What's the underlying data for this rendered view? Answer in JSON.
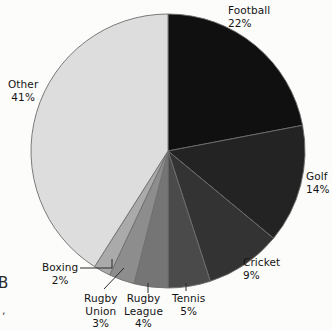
{
  "chart_data": {
    "type": "pie",
    "title": "",
    "subtitle": "",
    "xlabel": "",
    "ylabel": "",
    "legend_position": "none",
    "labels_position": "outside",
    "grid": false,
    "units": "percent",
    "total": 100,
    "start_angle_deg": 0,
    "direction": "clockwise",
    "categories": [
      "Football",
      "Golf",
      "Cricket",
      "Tennis",
      "Rugby League",
      "Rugby Union",
      "Boxing",
      "Other"
    ],
    "values": [
      22,
      14,
      9,
      5,
      4,
      3,
      2,
      41
    ],
    "slices": [
      {
        "name": "Football",
        "label": "Football",
        "pct_text": "22%",
        "value": 22,
        "color": "#101010",
        "label_align": "left",
        "leader": "none"
      },
      {
        "name": "Golf",
        "label": "Golf",
        "pct_text": "14%",
        "value": 14,
        "color": "#232323",
        "label_align": "left",
        "leader": "none"
      },
      {
        "name": "Cricket",
        "label": "Cricket",
        "pct_text": "9%",
        "value": 9,
        "color": "#333333",
        "label_align": "left",
        "leader": "none"
      },
      {
        "name": "Tennis",
        "label": "Tennis",
        "pct_text": "5%",
        "value": 5,
        "color": "#4a4a4a",
        "label_align": "center",
        "leader": "tick"
      },
      {
        "name": "Rugby League",
        "label": "Rugby\nLeague",
        "pct_text": "4%",
        "value": 4,
        "color": "#757575",
        "label_align": "center",
        "leader": "tick"
      },
      {
        "name": "Rugby Union",
        "label": "Rugby\nUnion",
        "pct_text": "3%",
        "value": 3,
        "color": "#8d8d8d",
        "label_align": "center",
        "leader": "diagonal"
      },
      {
        "name": "Boxing",
        "label": "Boxing",
        "pct_text": "2%",
        "value": 2,
        "color": "#aaaaaa",
        "label_align": "center",
        "leader": "elbow"
      },
      {
        "name": "Other",
        "label": "Other",
        "pct_text": "41%",
        "value": 41,
        "color": "#dddddd",
        "label_align": "center",
        "leader": "none"
      }
    ],
    "geometry": {
      "cx": 168,
      "cy": 151,
      "r": 137
    },
    "style": {
      "background": "#fcfcfa",
      "outline": "#6d6d6d",
      "text": "#141414"
    }
  },
  "labels": {
    "football": {
      "name": "Football",
      "pct": "22%"
    },
    "golf": {
      "name": "Golf",
      "pct": "14%"
    },
    "cricket": {
      "name": "Cricket",
      "pct": "9%"
    },
    "tennis": {
      "name": "Tennis",
      "pct": "5%"
    },
    "rugby_league": {
      "line1": "Rugby",
      "line2": "League",
      "pct": "4%"
    },
    "rugby_union": {
      "line1": "Rugby",
      "line2": "Union",
      "pct": "3%"
    },
    "boxing": {
      "name": "Boxing",
      "pct": "2%"
    },
    "other": {
      "name": "Other",
      "pct": "41%"
    }
  },
  "page_edge": {
    "clipped_glyph": "B",
    "clipped_mark": ","
  }
}
